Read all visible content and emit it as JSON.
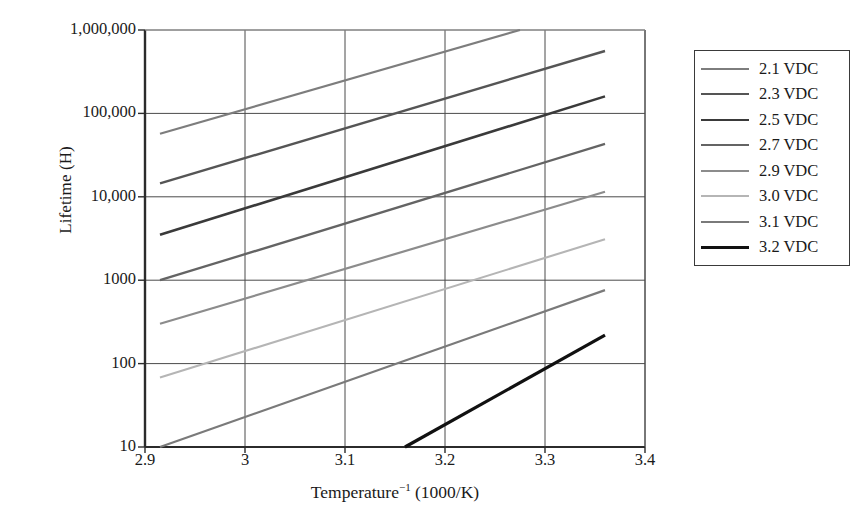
{
  "chart_data": {
    "type": "line",
    "title": "",
    "xlabel": "Temperature⁻¹ (1000/K)",
    "ylabel": "Lifetime (H)",
    "xlim": [
      2.9,
      3.4
    ],
    "ylim": [
      10,
      1000000
    ],
    "yscale": "log",
    "grid": true,
    "legend_position": "right-outside",
    "xticks": [
      "2.9",
      "3",
      "3.1",
      "3.2",
      "3.3",
      "3.4"
    ],
    "xtick_values": [
      2.9,
      3.0,
      3.1,
      3.2,
      3.3,
      3.4
    ],
    "yticks": [
      "10",
      "100",
      "1000",
      "10,000",
      "100,000",
      "1,000,000"
    ],
    "ytick_values": [
      10,
      100,
      1000,
      10000,
      100000,
      1000000
    ],
    "series": [
      {
        "name": "2.1 VDC",
        "color": "#7d7d7d",
        "width": 2.2,
        "x": [
          2.915,
          3.275
        ],
        "y": [
          57000,
          1000000
        ]
      },
      {
        "name": "2.3 VDC",
        "color": "#555555",
        "width": 2.4,
        "x": [
          2.915,
          3.36
        ],
        "y": [
          14500,
          560000
        ]
      },
      {
        "name": "2.5 VDC",
        "color": "#3a3a3a",
        "width": 2.6,
        "x": [
          2.915,
          3.36
        ],
        "y": [
          3500,
          160000
        ]
      },
      {
        "name": "2.7 VDC",
        "color": "#646464",
        "width": 2.3,
        "x": [
          2.915,
          3.36
        ],
        "y": [
          1000,
          43000
        ]
      },
      {
        "name": "2.9 VDC",
        "color": "#8c8c8c",
        "width": 2.2,
        "x": [
          2.915,
          3.36
        ],
        "y": [
          300,
          11500
        ]
      },
      {
        "name": "3.0 VDC",
        "color": "#b5b5b5",
        "width": 2.1,
        "x": [
          2.915,
          3.36
        ],
        "y": [
          68,
          3100
        ]
      },
      {
        "name": "3.1 VDC",
        "color": "#7a7a7a",
        "width": 2.2,
        "x": [
          2.915,
          3.36
        ],
        "y": [
          10,
          760
        ]
      },
      {
        "name": "3.2 VDC",
        "color": "#111111",
        "width": 3.2,
        "x": [
          3.16,
          3.36
        ],
        "y": [
          10,
          220
        ]
      }
    ]
  },
  "legend": {
    "items": [
      {
        "label": "2.1 VDC"
      },
      {
        "label": "2.3 VDC"
      },
      {
        "label": "2.5 VDC"
      },
      {
        "label": "2.7 VDC"
      },
      {
        "label": "2.9 VDC"
      },
      {
        "label": "3.0 VDC"
      },
      {
        "label": "3.1 VDC"
      },
      {
        "label": "3.2 VDC"
      }
    ]
  },
  "axes": {
    "x_title_main": "Temperature",
    "x_title_sup": "−1",
    "x_title_unit": " (1000/K)",
    "y_title": "Lifetime (H)"
  },
  "style": {
    "axis_color": "#2b2b2b",
    "grid_color": "#4a4a4a",
    "background": "#ffffff",
    "legend_border": "#3a3a3a"
  }
}
